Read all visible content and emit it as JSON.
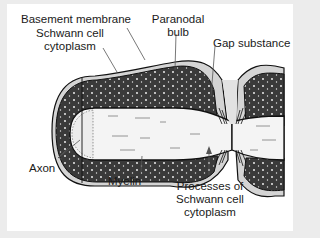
{
  "figure": {
    "labels": {
      "basement_membrane": "Basement membrane",
      "schwann_cytoplasm_line1": "Schwann cell",
      "schwann_cytoplasm_line2": "cytoplasm",
      "paranodal_line1": "Paranodal",
      "paranodal_line2": "bulb",
      "gap_substance": "Gap substance",
      "axon": "Axon",
      "myelin": "Myelin",
      "processes_line1": "Processes of",
      "processes_line2": "Schwann cell",
      "processes_line3": "cytoplasm"
    },
    "colors": {
      "myelin": "#3a3a3a",
      "cytoplasm": "#d4d4d4",
      "axon": "#f4f4f4",
      "outline": "#111111",
      "background": "#ffffff",
      "frame": "#ececec"
    }
  }
}
